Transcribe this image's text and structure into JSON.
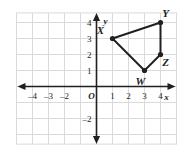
{
  "chart_data": {
    "type": "scatter",
    "title": "",
    "xlabel": "x",
    "ylabel": "y",
    "xlim": [
      -5,
      5
    ],
    "ylim": [
      -3,
      5
    ],
    "grid": true,
    "legend": "none",
    "origin_label": "O",
    "x_ticks": [
      -4,
      -3,
      -2,
      1,
      2,
      3,
      4
    ],
    "x_tick_labels": [
      "–4",
      "–3",
      "–2",
      "1",
      "2",
      "3",
      "4"
    ],
    "y_ticks": [
      4,
      3,
      2,
      1,
      -2
    ],
    "y_tick_labels": [
      "4",
      "3",
      "2",
      "1",
      "–2"
    ],
    "shape": "quadrilateral",
    "vertex_order": [
      "X",
      "Y",
      "Z",
      "W"
    ],
    "points": [
      {
        "label": "X",
        "x": 1,
        "y": 3,
        "label_dx": -12,
        "label_dy": -5
      },
      {
        "label": "Y",
        "x": 4,
        "y": 4,
        "label_dx": 5,
        "label_dy": -6
      },
      {
        "label": "Z",
        "x": 4,
        "y": 2,
        "label_dx": 5,
        "label_dy": 11
      },
      {
        "label": "W",
        "x": 3,
        "y": 1,
        "label_dx": -4,
        "label_dy": 14
      }
    ],
    "edges": [
      [
        "X",
        "Y"
      ],
      [
        "Y",
        "Z"
      ],
      [
        "Z",
        "W"
      ],
      [
        "W",
        "X"
      ]
    ],
    "colors": {
      "grid": "#d9d9de",
      "axis": "#231f20",
      "shape_stroke": "#231f20",
      "vertex_fill": "#231f20",
      "background": "#ffffff"
    }
  }
}
